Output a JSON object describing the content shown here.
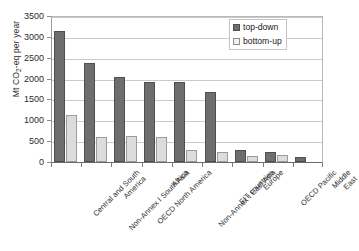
{
  "chart_data": {
    "type": "bar",
    "title": "",
    "xlabel": "",
    "ylabel": "Mt CO2-eq per year",
    "ylabel_prefix": "Mt CO",
    "ylabel_sub": "2",
    "ylabel_suffix": "-eq per year",
    "ylim": [
      0,
      3500
    ],
    "ytick_step": 500,
    "yticks": [
      3500,
      3000,
      2500,
      2000,
      1500,
      1000,
      500,
      0
    ],
    "grid": true,
    "grid_axis": "y",
    "legend_position": "top-right",
    "categories": [
      "Central and South\nAmerica",
      "Non-Annex I South Asia",
      "OECD North America",
      "Africa",
      "Non-Annex I East Asia",
      "EIT countries",
      "Europe",
      "OECD Pacific",
      "Middle East"
    ],
    "series": [
      {
        "name": "top-down",
        "color": "#6e6e6e",
        "values": [
          3140,
          2370,
          2040,
          1920,
          1920,
          1690,
          300,
          250,
          125
        ]
      },
      {
        "name": "bottom-up",
        "color": "#dcdcdc",
        "values": [
          1130,
          600,
          615,
          595,
          290,
          245,
          145,
          180,
          null
        ]
      }
    ]
  },
  "legend": {
    "items": [
      {
        "label": "top-down",
        "swatch": "top-down"
      },
      {
        "label": "bottom-up",
        "swatch": "bottom-up"
      }
    ]
  },
  "colors": {
    "top_down": "#6e6e6e",
    "bottom_up": "#dcdcdc",
    "grid": "#c9c9c9",
    "axis": "#6a6a6a",
    "text": "#2e2e2e",
    "background": "#ffffff"
  }
}
